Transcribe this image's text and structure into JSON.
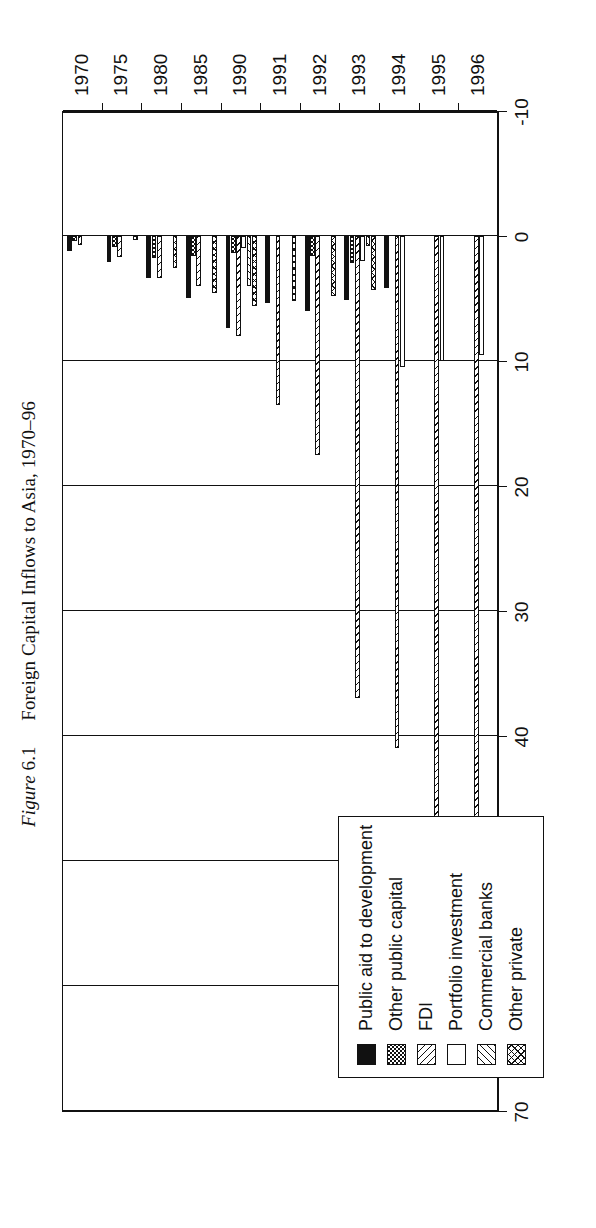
{
  "caption": {
    "figure_word": "Figure",
    "number": "6.1",
    "title": "Foreign Capital Inflows to Asia, 1970–96"
  },
  "legend": {
    "items": [
      {
        "label": "Public aid to development",
        "pattern": "solid-black",
        "key": "aid"
      },
      {
        "label": "Other public capital",
        "pattern": "dotted",
        "key": "other_public"
      },
      {
        "label": "FDI",
        "pattern": "hatch-right",
        "key": "fdi"
      },
      {
        "label": "Portfolio investment",
        "pattern": "white",
        "key": "portfolio"
      },
      {
        "label": "Commercial banks",
        "pattern": "hatch-left",
        "key": "banks"
      },
      {
        "label": "Other private",
        "pattern": "crosshatch",
        "key": "other_private"
      }
    ]
  },
  "chart_data": {
    "type": "bar",
    "orientation": "vertical-rotated",
    "title": "Foreign Capital Inflows to Asia, 1970–96",
    "xlabel": "",
    "ylabel": "",
    "ylim": [
      -10,
      70
    ],
    "yticks": [
      -10,
      0,
      10,
      20,
      30,
      40,
      50,
      60,
      70
    ],
    "ytick_labels": [
      "-10",
      "0",
      "10",
      "20",
      "30",
      "40",
      "50",
      "60",
      "70"
    ],
    "grid": true,
    "legend_position": "inside-left",
    "categories": [
      "1970",
      "1975",
      "1980",
      "1985",
      "1990",
      "1991",
      "1992",
      "1993",
      "1994",
      "1995",
      "1996"
    ],
    "series": [
      {
        "name": "Public aid to development",
        "values": [
          1.2,
          2.1,
          3.4,
          5.0,
          7.4,
          5.4,
          6.0,
          5.1,
          4.2,
          0,
          0
        ]
      },
      {
        "name": "Other public capital",
        "values": [
          0.4,
          0.9,
          1.8,
          1.6,
          1.4,
          0,
          1.6,
          2.2,
          0,
          0,
          0
        ]
      },
      {
        "name": "FDI",
        "values": [
          0.7,
          1.7,
          3.4,
          4.0,
          8.0,
          13.5,
          17.5,
          37.0,
          41.0,
          53.0,
          57.5
        ]
      },
      {
        "name": "Portfolio investment",
        "values": [
          0,
          0,
          0,
          0,
          1.0,
          0,
          0,
          2.0,
          10.5,
          10.0,
          9.5
        ]
      },
      {
        "name": "Commercial banks",
        "values": [
          0,
          0,
          0,
          0,
          4.0,
          0,
          0,
          0.8,
          0,
          0,
          0
        ]
      },
      {
        "name": "Other private",
        "values": [
          0,
          0.3,
          2.6,
          4.6,
          5.6,
          5.2,
          4.8,
          4.3,
          0,
          0,
          0
        ]
      }
    ]
  },
  "axes": {
    "value_ticks": [
      "70",
      "60",
      "50",
      "40",
      "30",
      "20",
      "10",
      "0",
      "-10"
    ],
    "category_ticks": [
      "1970",
      "1975",
      "1980",
      "1985",
      "1990",
      "1991",
      "1992",
      "1993",
      "1994",
      "1995",
      "1996"
    ]
  }
}
